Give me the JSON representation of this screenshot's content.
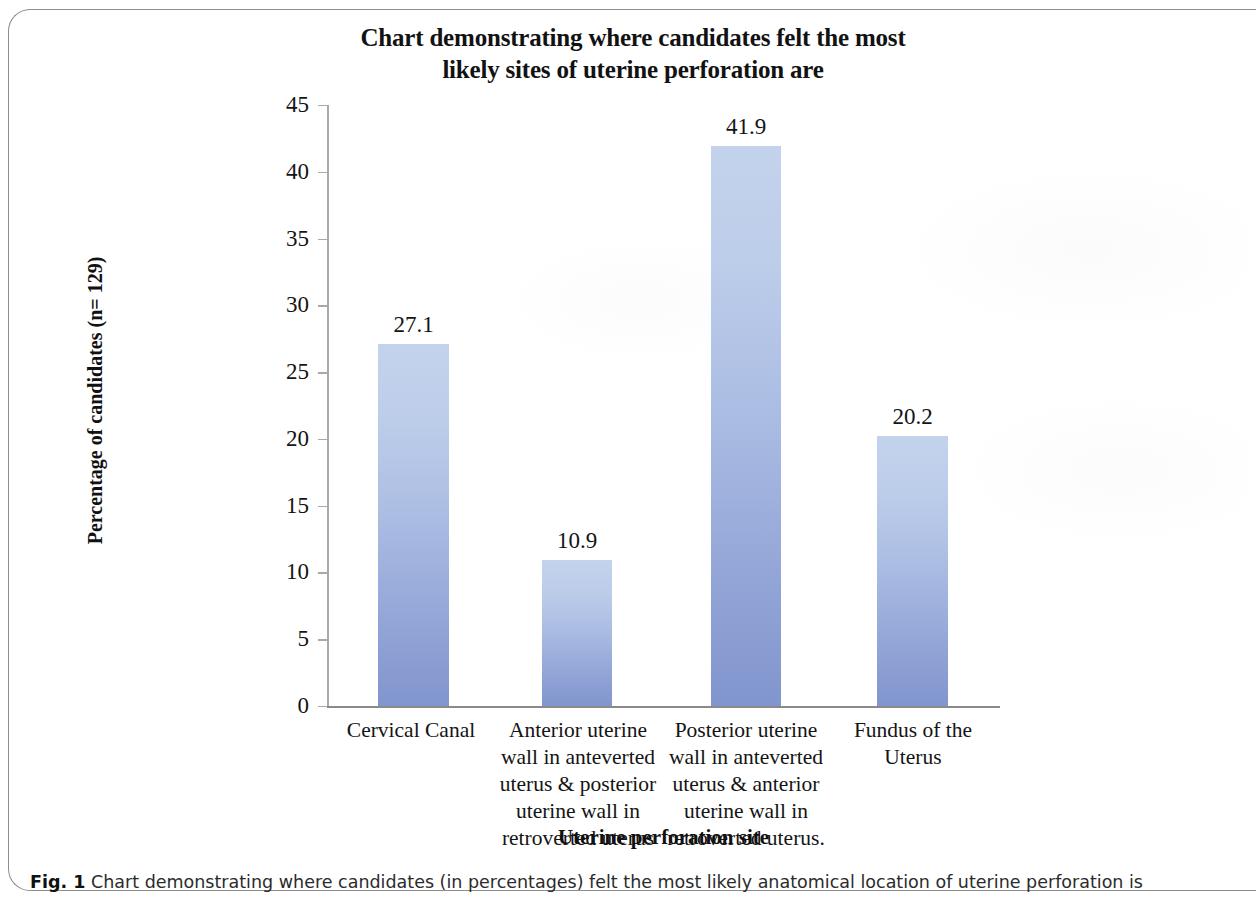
{
  "figure": {
    "title_lines": [
      "Chart demonstrating where candidates felt the most",
      "likely sites of uterine perforation are"
    ],
    "caption_label": "Fig. 1",
    "caption_text": "Chart demonstrating where candidates (in percentages) felt the most likely anatomical location of uterine perforation is"
  },
  "chart_data": {
    "type": "bar",
    "title": "Chart demonstrating where candidates felt the most likely sites of uterine perforation are",
    "xlabel": "Uterine perforation site",
    "ylabel": "Percentage of candidates (n= 129)",
    "ylim": [
      0,
      45
    ],
    "yticks": [
      0,
      5,
      10,
      15,
      20,
      25,
      30,
      35,
      40,
      45
    ],
    "ytick_labels": [
      "0",
      "5",
      "10",
      "15",
      "20",
      "25",
      "30",
      "35",
      "40",
      "45"
    ],
    "grid": false,
    "legend": false,
    "bar_color_top": "#c4d3ec",
    "bar_color_bottom": "#8195ce",
    "categories": [
      "Cervical Canal",
      "Anterior uterine wall in anteverted uterus & posterior uterine wall in retroverted uterus",
      "Posterior uterine wall in anteverted uterus & anterior uterine wall in retroverted uterus.",
      "Fundus of the Uterus"
    ],
    "category_label_lines": [
      [
        "Cervical Canal"
      ],
      [
        "Anterior uterine",
        "wall in anteverted",
        "uterus & posterior",
        "uterine wall in",
        "retroverted uterus"
      ],
      [
        "Posterior uterine",
        "wall in anteverted",
        "uterus & anterior",
        "uterine wall in",
        "retroverted uterus."
      ],
      [
        "Fundus of the",
        "Uterus"
      ]
    ],
    "values": [
      27.1,
      10.9,
      41.9,
      20.2
    ],
    "value_labels": [
      "27.1",
      "10.9",
      "41.9",
      "20.2"
    ]
  }
}
